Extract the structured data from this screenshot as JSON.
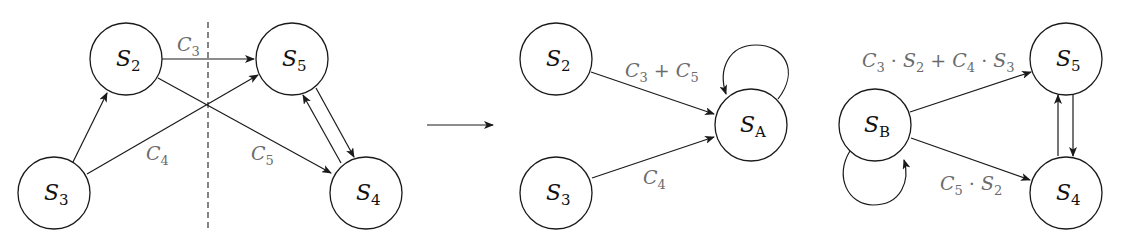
{
  "colors": {
    "stroke": "#1a1a1a",
    "node_text": "#111111",
    "edge_label_text": "#6b6b6b",
    "background": "#ffffff"
  },
  "panels": {
    "original": {
      "nodes": [
        {
          "id": "S2",
          "base": "S",
          "sub": "2",
          "cx": 126,
          "cy": 59
        },
        {
          "id": "S3",
          "base": "S",
          "sub": "3",
          "cx": 54,
          "cy": 193
        },
        {
          "id": "S5",
          "base": "S",
          "sub": "5",
          "cx": 292,
          "cy": 59
        },
        {
          "id": "S4",
          "base": "S",
          "sub": "4",
          "cx": 366,
          "cy": 193
        }
      ],
      "edges": [
        {
          "from": "S3",
          "to": "S2",
          "label": ""
        },
        {
          "from": "S2",
          "to": "S5",
          "label": "C3",
          "label_base": "C",
          "label_sub": "3"
        },
        {
          "from": "S3",
          "to": "S5",
          "label": "C4",
          "label_base": "C",
          "label_sub": "4"
        },
        {
          "from": "S2",
          "to": "S4",
          "label": "C5",
          "label_base": "C",
          "label_sub": "5"
        },
        {
          "from": "S5",
          "to": "S4",
          "label": ""
        },
        {
          "from": "S4",
          "to": "S5",
          "label": ""
        }
      ],
      "cut_line": {
        "style": "dashed",
        "x": 208
      }
    },
    "transform_arrow": {
      "direction": "right"
    },
    "merged_A": {
      "nodes": [
        {
          "id": "S2",
          "base": "S",
          "sub": "2",
          "cx": 556,
          "cy": 59
        },
        {
          "id": "S3",
          "base": "S",
          "sub": "3",
          "cx": 556,
          "cy": 193
        },
        {
          "id": "SA",
          "base": "S",
          "sub": "A",
          "cx": 751,
          "cy": 125
        }
      ],
      "edges": [
        {
          "from": "S2",
          "to": "SA",
          "label": "C3 + C5",
          "parts": {
            "c1": "C",
            "s1": "3",
            "op": " + ",
            "c2": "C",
            "s2": "5"
          }
        },
        {
          "from": "S3",
          "to": "SA",
          "label": "C4",
          "label_base": "C",
          "label_sub": "4"
        },
        {
          "from": "SA",
          "to": "SA",
          "label": "",
          "self_loop": "top"
        }
      ]
    },
    "merged_B": {
      "nodes": [
        {
          "id": "SB",
          "base": "S",
          "sub": "B",
          "cx": 875,
          "cy": 125
        },
        {
          "id": "S5",
          "base": "S",
          "sub": "5",
          "cx": 1066,
          "cy": 59
        },
        {
          "id": "S4",
          "base": "S",
          "sub": "4",
          "cx": 1066,
          "cy": 193
        }
      ],
      "edges": [
        {
          "from": "SB",
          "to": "S5",
          "label": "C3 · S2 + C4 · S3",
          "parts": {
            "c1": "C",
            "s1": "3",
            "dot1": " · ",
            "v1": "S",
            "vs1": "2",
            "plus": " + ",
            "c2": "C",
            "s2": "4",
            "dot2": " · ",
            "v2": "S",
            "vs2": "3"
          }
        },
        {
          "from": "SB",
          "to": "S4",
          "label": "C5 · S2",
          "parts": {
            "c1": "C",
            "s1": "5",
            "dot": " · ",
            "v1": "S",
            "vs1": "2"
          }
        },
        {
          "from": "S5",
          "to": "S4",
          "label": ""
        },
        {
          "from": "S4",
          "to": "S5",
          "label": ""
        },
        {
          "from": "SB",
          "to": "SB",
          "label": "",
          "self_loop": "bottom"
        }
      ]
    }
  }
}
